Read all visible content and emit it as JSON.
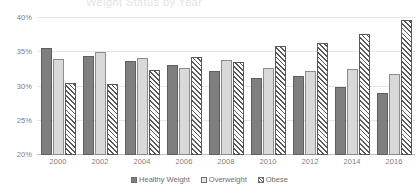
{
  "title_remnant": "Weight Status by Year",
  "chart_data": {
    "type": "bar",
    "title": "",
    "xlabel": "",
    "ylabel": "",
    "ylim": [
      20,
      40
    ],
    "yticks": [
      "40%",
      "35%",
      "30%",
      "25%",
      "20%"
    ],
    "ytick_values": [
      40,
      35,
      30,
      25,
      20
    ],
    "grid": true,
    "legend_position": "bottom",
    "categories": [
      "2000",
      "2002",
      "2004",
      "2006",
      "2008",
      "2010",
      "2012",
      "2014",
      "2016"
    ],
    "series": [
      {
        "name": "Healthy Weight",
        "style": "solid-dark",
        "color": "#7f7f7f",
        "values": [
          35.6,
          34.4,
          33.7,
          33.1,
          32.2,
          31.3,
          31.5,
          29.9,
          29.0
        ]
      },
      {
        "name": "Overweight",
        "style": "solid-light",
        "color": "#d9d9d9",
        "values": [
          34.0,
          35.1,
          34.1,
          32.7,
          33.9,
          32.7,
          32.2,
          32.6,
          31.9
        ]
      },
      {
        "name": "Obese",
        "style": "diagonal-hatch",
        "color": "#595959",
        "values": [
          30.5,
          30.4,
          32.4,
          34.3,
          33.6,
          35.9,
          36.4,
          37.6,
          39.7
        ]
      }
    ]
  }
}
